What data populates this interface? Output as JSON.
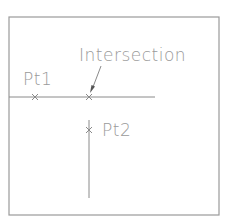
{
  "diagram": {
    "labels": {
      "intersection": "Intersection",
      "pt1": "Pt1",
      "pt2": "Pt2"
    },
    "elements": {
      "frame": {
        "x1": 9,
        "y1": 17,
        "x2": 219,
        "y2": 215
      },
      "horizontal_line": {
        "x1": 9,
        "y1": 97,
        "x2": 155,
        "y2": 97
      },
      "vertical_line": {
        "x1": 89,
        "y1": 120,
        "x2": 89,
        "y2": 198
      },
      "pt1_marker": {
        "x": 35,
        "y": 97
      },
      "intersection_marker": {
        "x": 89,
        "y": 97
      },
      "pt2_marker": {
        "x": 89,
        "y": 130
      },
      "leader_arrow": {
        "from": [
          101,
          65
        ],
        "to": [
          91,
          92
        ]
      }
    },
    "colors": {
      "line": "#8a8a8a",
      "text": "#9a9a9a",
      "background": "#ffffff"
    }
  }
}
